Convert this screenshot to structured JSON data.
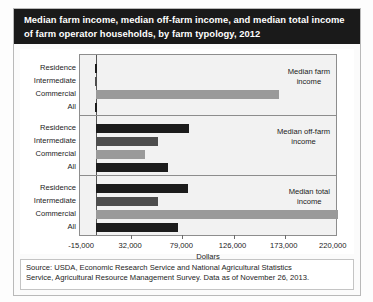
{
  "figure": {
    "title_lines": [
      "Median farm income, median off-farm income, and median total income",
      "of farm operator households, by farm typology, 2012"
    ],
    "source_lines": [
      "Source: USDA, Economic Research Service and National Agricultural Statistics",
      "Service, Agricultural Resource Management Survey. Data as of November 26, 2013."
    ]
  },
  "chart_data": {
    "type": "bar",
    "orientation": "horizontal",
    "title": "Median farm income, median off-farm income, and median total income of farm operator households, by farm typology, 2012",
    "xlabel": "Dollars",
    "ylabel": "",
    "xlim": [
      -15000,
      220000
    ],
    "xticks": [
      -15000,
      32000,
      79000,
      126000,
      173000,
      220000
    ],
    "xticklabels": [
      "-15,000",
      "32,000",
      "79,000",
      "126,000",
      "173,000",
      "220,000"
    ],
    "grid": false,
    "legend_position": "inside-right",
    "categories": [
      "Residence",
      "Intermediate",
      "Commercial",
      "All"
    ],
    "panels": [
      {
        "label_lines": [
          "Median farm",
          "income"
        ],
        "values": [
          -1500,
          -800,
          168000,
          -1200
        ],
        "bars": [
          {
            "category": "Residence",
            "value": -1500,
            "color": "#1c1c1c"
          },
          {
            "category": "Intermediate",
            "value": -800,
            "color": "#4d4d4d"
          },
          {
            "category": "Commercial",
            "value": 168000,
            "color": "#9a9a9a"
          },
          {
            "category": "All",
            "value": -1200,
            "color": "#1c1c1c"
          }
        ]
      },
      {
        "label_lines": [
          "Median off-farm",
          "income"
        ],
        "values": [
          85000,
          57000,
          45000,
          66000
        ],
        "bars": [
          {
            "category": "Residence",
            "value": 85000,
            "color": "#1c1c1c"
          },
          {
            "category": "Intermediate",
            "value": 57000,
            "color": "#4d4d4d"
          },
          {
            "category": "Commercial",
            "value": 45000,
            "color": "#9a9a9a"
          },
          {
            "category": "All",
            "value": 66000,
            "color": "#1c1c1c"
          }
        ]
      },
      {
        "label_lines": [
          "Median total",
          "income"
        ],
        "values": [
          84000,
          57000,
          222000,
          75000
        ],
        "bars": [
          {
            "category": "Residence",
            "value": 84000,
            "color": "#1c1c1c"
          },
          {
            "category": "Intermediate",
            "value": 57000,
            "color": "#4d4d4d"
          },
          {
            "category": "Commercial",
            "value": 222000,
            "color": "#9a9a9a"
          },
          {
            "category": "All",
            "value": 75000,
            "color": "#1c1c1c"
          }
        ]
      }
    ]
  }
}
